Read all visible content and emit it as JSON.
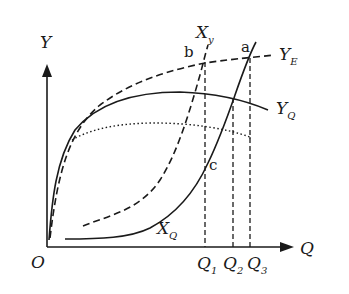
{
  "diagram": {
    "axes": {
      "y_label": "Y",
      "x_label": "Q",
      "origin_label": "O"
    },
    "x_ticks": [
      {
        "base": "Q",
        "sub": "1"
      },
      {
        "base": "Q",
        "sub": "2"
      },
      {
        "base": "Q",
        "sub": "3"
      }
    ],
    "curves": {
      "YE": {
        "base": "Y",
        "sub": "E",
        "style": "dashed"
      },
      "YQ": {
        "base": "Y",
        "sub": "Q",
        "style": "solid"
      },
      "XQ": {
        "base": "X",
        "sub": "Q",
        "style": "solid"
      },
      "Xy": {
        "base": "X",
        "sub": "y",
        "style": "dashed"
      },
      "dotted": {
        "style": "dotted"
      }
    },
    "points": {
      "a": "a",
      "b": "b",
      "c": "c"
    },
    "colors": {
      "ink": "#1a1a1a",
      "background": "#ffffff"
    }
  }
}
